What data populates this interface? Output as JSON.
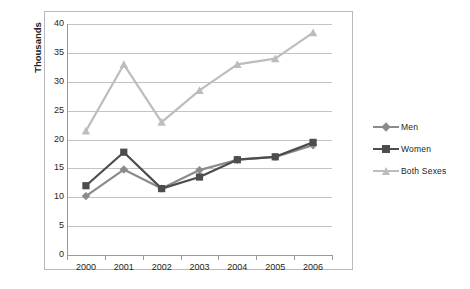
{
  "chart_data": {
    "type": "line",
    "title": "",
    "xlabel": "",
    "ylabel": "Thousands",
    "categories": [
      "2000",
      "2001",
      "2002",
      "2003",
      "2004",
      "2005",
      "2006"
    ],
    "ylim": [
      0,
      40
    ],
    "ytick_step": 5,
    "yticks": [
      "0",
      "5",
      "10",
      "15",
      "20",
      "25",
      "30",
      "35",
      "40"
    ],
    "grid": true,
    "legend_position": "right",
    "series": [
      {
        "name": "Men",
        "color": "#8b8b8b",
        "marker": "diamond",
        "values": [
          10.2,
          14.8,
          11.5,
          14.7,
          16.5,
          17.0,
          19.0
        ]
      },
      {
        "name": "Women",
        "color": "#4d4d4d",
        "marker": "square",
        "values": [
          12.0,
          17.8,
          11.5,
          13.5,
          16.5,
          17.0,
          19.5
        ]
      },
      {
        "name": "Both Sexes",
        "color": "#bdbdbd",
        "marker": "triangle",
        "values": [
          21.5,
          33.0,
          23.0,
          28.5,
          33.0,
          34.0,
          38.5
        ]
      }
    ]
  },
  "legend": {
    "items": [
      {
        "label": "Men"
      },
      {
        "label": "Women"
      },
      {
        "label": "Both Sexes"
      }
    ]
  },
  "colors": {
    "grid": "#c3c3c3",
    "axis": "#9a9a9a",
    "frame": "#b9b9b9",
    "background": "#ffffff",
    "text": "#231f20"
  }
}
